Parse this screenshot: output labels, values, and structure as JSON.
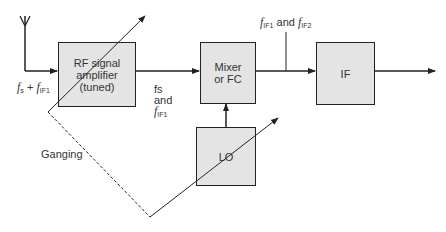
{
  "diagram": {
    "type": "superheterodyne receiver block diagram",
    "blocks": {
      "rf": {
        "line1": "RF signal",
        "line2": "amplifier",
        "line3": "(tuned)"
      },
      "mixer": {
        "line1": "Mixer",
        "line2": "or FC"
      },
      "if": {
        "label": "IF"
      },
      "lo": {
        "label": "LO"
      }
    },
    "labels": {
      "input_f": "f",
      "input_f_sub": "s",
      "input_plus": " + ",
      "input_if": "f",
      "input_if_sub": "IF1",
      "rf_out_line1": "fs",
      "rf_out_line2": "and",
      "rf_out_f": "f",
      "rf_out_sub": "IF1",
      "mix_out_f1": "f",
      "mix_out_sub1": "IF1",
      "mix_out_and": " and ",
      "mix_out_f2": "f",
      "mix_out_sub2": "IF2",
      "ganging": "Ganging"
    },
    "colors": {
      "box_fill": "#e4e4e4",
      "line": "#222222"
    }
  }
}
